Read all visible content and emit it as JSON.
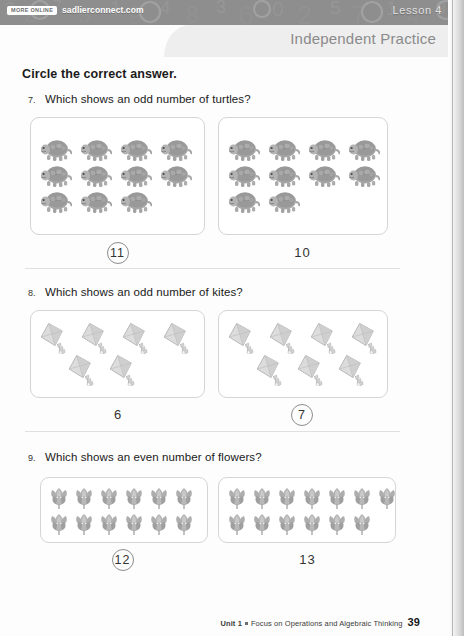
{
  "header": {
    "badge_label": "MORE ONLINE",
    "site": "sadlierconnect.com",
    "lesson": "Lesson 4"
  },
  "practice": {
    "title": "Independent Practice"
  },
  "instruction": "Circle the correct answer.",
  "questions": [
    {
      "number": "7.",
      "prompt": "Which shows an odd number of turtles?",
      "icon": "turtle-icon",
      "options": [
        {
          "label": "11",
          "count": 11,
          "rows": [
            4,
            4,
            3
          ],
          "selected": true
        },
        {
          "label": "10",
          "count": 10,
          "rows": [
            4,
            4,
            2
          ],
          "selected": false
        }
      ]
    },
    {
      "number": "8.",
      "prompt": "Which shows an odd number of kites?",
      "icon": "kite-icon",
      "options": [
        {
          "label": "6",
          "count": 6,
          "rows": [
            4,
            2
          ],
          "selected": false
        },
        {
          "label": "7",
          "count": 7,
          "rows": [
            4,
            3
          ],
          "selected": true
        }
      ]
    },
    {
      "number": "9.",
      "prompt": "Which shows an even number of flowers?",
      "icon": "flower-icon",
      "options": [
        {
          "label": "12",
          "count": 12,
          "rows": [
            6,
            6
          ],
          "selected": true
        },
        {
          "label": "13",
          "count": 13,
          "rows": [
            7,
            6
          ],
          "selected": false
        }
      ]
    }
  ],
  "footer": {
    "unit": "Unit 1",
    "description": "Focus on Operations and Algebraic Thinking",
    "page_number": "39"
  },
  "colors": {
    "header_band": "#8e8e8e",
    "practice_band": "#eeeeee",
    "practice_text": "#8a8a8a",
    "box_border": "#d5d5d5",
    "answer_circle": "#8d8d8d"
  }
}
